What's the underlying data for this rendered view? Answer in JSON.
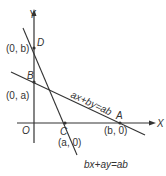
{
  "diagram": {
    "type": "coordinate-geometry",
    "axes": {
      "x_label": "X",
      "y_label": "Y",
      "origin_label": "O"
    },
    "points": [
      {
        "name": "D",
        "coords": "(0, b)"
      },
      {
        "name": "B",
        "coords": "(0, a)"
      },
      {
        "name": "C",
        "coords": "(a, 0)"
      },
      {
        "name": "A",
        "coords": "(b, 0)"
      }
    ],
    "lines": [
      {
        "equation": "ax+by=ab",
        "through": [
          "B",
          "A"
        ]
      },
      {
        "equation": "bx+ay=ab",
        "through": [
          "D",
          "C"
        ]
      }
    ],
    "colors": {
      "stroke": "#333333",
      "background": "#ffffff"
    }
  }
}
